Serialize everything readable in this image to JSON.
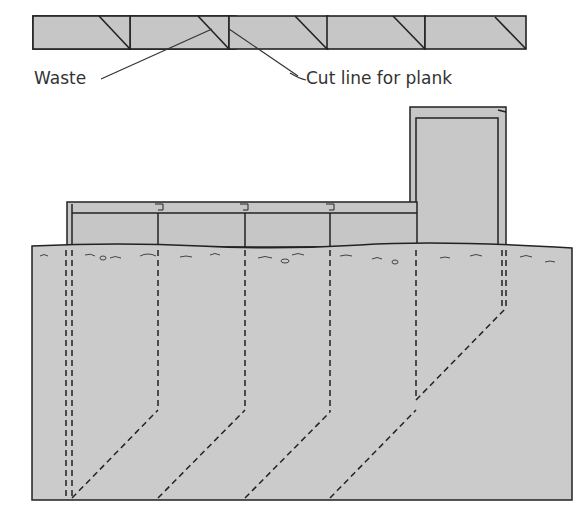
{
  "diagram": {
    "labels": {
      "waste": "Waste",
      "cut_line": "Cut line for plank"
    },
    "colors": {
      "fill": "#c6c6c6",
      "ground": "#cbcbcb",
      "stroke": "#222222",
      "background": "#ffffff"
    },
    "plank_strip": {
      "segments": 5,
      "description": "Board divided into 5 planks, each with a diagonal cut line"
    },
    "trench": {
      "planks_installed": 5,
      "description": "Cross-section of planks set in ground with dashed underground lines"
    }
  }
}
